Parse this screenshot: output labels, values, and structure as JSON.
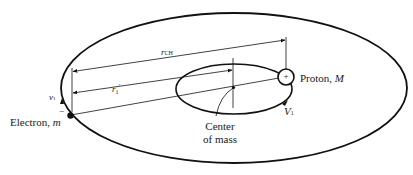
{
  "figure": {
    "top_caption_fragment": "",
    "labels": {
      "r_ch": "r",
      "r_ch_sub": "CH",
      "r1_prime": "r",
      "r1_prime_sub": "1",
      "r1_prime_sup": "′",
      "proton": "Proton, ",
      "proton_mass": "M",
      "electron": "Electron, ",
      "electron_mass": "m",
      "electron_charge": "−",
      "v1_small": "v",
      "v1_small_sub": "1",
      "v1_large": "V",
      "v1_large_sub": "1",
      "center_of_mass_line1": "Center",
      "center_of_mass_line2": "of mass",
      "proton_symbol": "+"
    },
    "colors": {
      "stroke": "#111111",
      "background": "#ffffff"
    }
  }
}
